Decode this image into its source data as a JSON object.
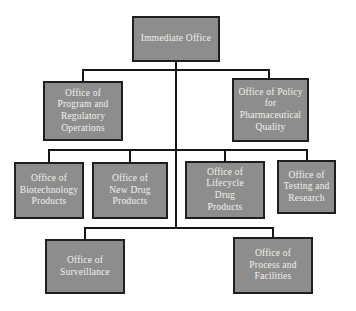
{
  "diagram": {
    "type": "org-chart",
    "root_label": "Immediate Office"
  },
  "colors": {
    "background": "#ffffff",
    "box_fill": "#8d8d8d",
    "box_border": "#1f1f1f",
    "box_text": "#f3f1ea",
    "connector": "#161616"
  },
  "nodes": [
    {
      "id": "immediate-office",
      "level": 1,
      "label": "Immediate Office",
      "lines": [
        "Immediate Office"
      ]
    },
    {
      "id": "office-of-program-and-regulatory-operations",
      "level": 2,
      "label": "Office of Program and Regulatory Operations",
      "lines": [
        "Office of",
        "Program and",
        "Regulatory",
        "Operations"
      ]
    },
    {
      "id": "office-of-policy-for-pharmaceutical-quality",
      "level": 2,
      "label": "Office of Policy for Pharmaceutical Quality",
      "lines": [
        "Office of Policy",
        "for",
        "Pharmaceutical",
        "Quality"
      ]
    },
    {
      "id": "office-of-biotechnology-products",
      "level": 3,
      "label": "Office of Biotechnology Products",
      "lines": [
        "Office of",
        "Biotechnology",
        "Products"
      ]
    },
    {
      "id": "office-of-new-drug-products",
      "level": 3,
      "label": "Office of New Drug Products",
      "lines": [
        "Office of",
        "New Drug",
        "Products"
      ]
    },
    {
      "id": "office-of-lifecycle-drug-products",
      "level": 3,
      "label": "Office of Lifecycle Drug Products",
      "lines": [
        "Office of",
        "Lifecycle",
        "Drug",
        "Products"
      ]
    },
    {
      "id": "office-of-testing-and-research",
      "level": 3,
      "label": "Office of Testing and Research",
      "lines": [
        "Office of",
        "Testing and",
        "Research"
      ]
    },
    {
      "id": "office-of-surveillance",
      "level": 4,
      "label": "Office of Surveillance",
      "lines": [
        "Office of",
        "Surveillance"
      ]
    },
    {
      "id": "office-of-process-and-facilities",
      "level": 4,
      "label": "Office of Process and Facilities",
      "lines": [
        "Office of",
        "Process and",
        "Facilities"
      ]
    }
  ],
  "structure": {
    "parent_of_all": "Immediate Office",
    "level_2": [
      "Office of Program and Regulatory Operations",
      "Office of Policy for Pharmaceutical Quality"
    ],
    "level_3": [
      "Office of Biotechnology Products",
      "Office of New Drug Products",
      "Office of Lifecycle Drug Products",
      "Office of Testing and Research"
    ],
    "level_4": [
      "Office of Surveillance",
      "Office of Process and Facilities"
    ]
  }
}
